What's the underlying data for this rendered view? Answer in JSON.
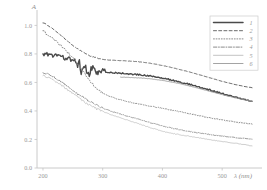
{
  "chart_data": {
    "type": "line",
    "title": "",
    "xlabel": "λ (nm)",
    "ylabel": "A",
    "xlim": [
      190,
      560
    ],
    "ylim": [
      0.0,
      1.08
    ],
    "xticks": [
      200,
      300,
      400,
      500
    ],
    "xtick_labels": [
      "200",
      "300",
      "400",
      "500"
    ],
    "yticks": [
      0.0,
      0.2,
      0.4,
      0.6,
      0.8,
      1.0
    ],
    "ytick_labels": [
      "0.0",
      "0.2",
      "0.4",
      "0.6",
      "0.8",
      "1.0"
    ],
    "grid": false,
    "legend_position": "top-right",
    "legend_entries": [
      {
        "label": "1",
        "style": "solid",
        "width": 1.5,
        "color": "#4a4a4a"
      },
      {
        "label": "2",
        "style": "dashed",
        "width": 1.0,
        "color": "#6a6a6a"
      },
      {
        "label": "3",
        "style": "dotted",
        "width": 1.0,
        "color": "#8a8a8a"
      },
      {
        "label": "4",
        "style": "dashdot",
        "width": 1.0,
        "color": "#8a8a8a"
      },
      {
        "label": "5",
        "style": "solid",
        "width": 0.8,
        "color": "#b4b4b4"
      },
      {
        "label": "6",
        "style": "solid",
        "width": 0.9,
        "color": "#9a9a9a"
      }
    ],
    "series": [
      {
        "name": "1",
        "style": "solid",
        "color": "#4a4a4a",
        "width": 1.4,
        "x": [
          200,
          205,
          210,
          215,
          220,
          225,
          230,
          235,
          240,
          245,
          250,
          255,
          258,
          261,
          264,
          267,
          270,
          273,
          276,
          279,
          282,
          285,
          288,
          292,
          296,
          300,
          305,
          310,
          320,
          330,
          340,
          350,
          360,
          370,
          380,
          390,
          400,
          410,
          420,
          430,
          440,
          450,
          460,
          470,
          480,
          490,
          500,
          510,
          520,
          530,
          540,
          550
        ],
        "y": [
          0.795,
          0.8,
          0.797,
          0.793,
          0.79,
          0.786,
          0.781,
          0.775,
          0.768,
          0.762,
          0.756,
          0.748,
          0.7,
          0.735,
          0.672,
          0.718,
          0.665,
          0.706,
          0.69,
          0.66,
          0.7,
          0.672,
          0.69,
          0.668,
          0.683,
          0.7,
          0.676,
          0.668,
          0.667,
          0.665,
          0.662,
          0.658,
          0.655,
          0.65,
          0.645,
          0.638,
          0.63,
          0.622,
          0.612,
          0.602,
          0.592,
          0.582,
          0.57,
          0.558,
          0.546,
          0.534,
          0.522,
          0.51,
          0.498,
          0.487,
          0.477,
          0.468
        ]
      },
      {
        "name": "2",
        "style": "dashed",
        "color": "#6a6a6a",
        "width": 1.0,
        "x": [
          200,
          210,
          220,
          230,
          240,
          250,
          260,
          270,
          280,
          290,
          300,
          310,
          320,
          330,
          340,
          350,
          360,
          370,
          380,
          390,
          400,
          410,
          420,
          430,
          440,
          450,
          460,
          470,
          480,
          490,
          500,
          510,
          520,
          530,
          540,
          550
        ],
        "y": [
          1.02,
          0.995,
          0.965,
          0.93,
          0.895,
          0.86,
          0.83,
          0.805,
          0.785,
          0.772,
          0.762,
          0.757,
          0.755,
          0.753,
          0.751,
          0.748,
          0.745,
          0.74,
          0.734,
          0.727,
          0.719,
          0.71,
          0.7,
          0.69,
          0.679,
          0.668,
          0.656,
          0.644,
          0.632,
          0.62,
          0.608,
          0.597,
          0.587,
          0.578,
          0.57,
          0.563
        ]
      },
      {
        "name": "3",
        "style": "dotted",
        "color": "#8a8a8a",
        "width": 1.0,
        "x": [
          200,
          210,
          220,
          230,
          240,
          250,
          255,
          260,
          265,
          270,
          275,
          280,
          285,
          290,
          295,
          300,
          310,
          320,
          330,
          340,
          350,
          360,
          370,
          380,
          390,
          400,
          410,
          420,
          430,
          440,
          450,
          460,
          470,
          480,
          490,
          500,
          510,
          520,
          530,
          540,
          550
        ],
        "y": [
          0.96,
          0.93,
          0.895,
          0.858,
          0.818,
          0.775,
          0.75,
          0.72,
          0.69,
          0.66,
          0.632,
          0.605,
          0.58,
          0.558,
          0.54,
          0.525,
          0.505,
          0.49,
          0.478,
          0.468,
          0.458,
          0.45,
          0.442,
          0.434,
          0.426,
          0.418,
          0.41,
          0.402,
          0.394,
          0.385,
          0.377,
          0.368,
          0.36,
          0.352,
          0.344,
          0.337,
          0.33,
          0.324,
          0.318,
          0.313,
          0.308
        ]
      },
      {
        "name": "4",
        "style": "dashdot",
        "color": "#8e8e8e",
        "width": 0.9,
        "x": [
          200,
          210,
          220,
          230,
          240,
          250,
          260,
          270,
          280,
          290,
          300,
          310,
          320,
          330,
          340,
          350,
          360,
          370,
          380,
          390,
          400,
          410,
          420,
          430,
          440,
          450,
          460,
          470,
          480,
          490,
          500,
          510,
          520,
          530,
          540,
          550
        ],
        "y": [
          0.672,
          0.655,
          0.632,
          0.605,
          0.575,
          0.545,
          0.515,
          0.488,
          0.462,
          0.44,
          0.42,
          0.404,
          0.39,
          0.378,
          0.366,
          0.354,
          0.342,
          0.33,
          0.318,
          0.306,
          0.295,
          0.285,
          0.276,
          0.268,
          0.26,
          0.253,
          0.247,
          0.241,
          0.235,
          0.229,
          0.224,
          0.219,
          0.214,
          0.21,
          0.206,
          0.202
        ]
      },
      {
        "name": "5",
        "style": "solid",
        "color": "#c0c0c0",
        "width": 0.8,
        "x": [
          200,
          210,
          220,
          230,
          240,
          250,
          260,
          270,
          280,
          290,
          300,
          310,
          320,
          330,
          340,
          350,
          360,
          370,
          380,
          390,
          400,
          410,
          420,
          430,
          440,
          450,
          460,
          470,
          480,
          490,
          500,
          510,
          520,
          530,
          540,
          550
        ],
        "y": [
          0.648,
          0.63,
          0.608,
          0.582,
          0.552,
          0.52,
          0.49,
          0.462,
          0.436,
          0.414,
          0.396,
          0.38,
          0.366,
          0.352,
          0.338,
          0.324,
          0.31,
          0.296,
          0.283,
          0.27,
          0.258,
          0.248,
          0.24,
          0.233,
          0.226,
          0.219,
          0.212,
          0.205,
          0.198,
          0.192,
          0.186,
          0.18,
          0.174,
          0.168,
          0.162,
          0.155
        ]
      },
      {
        "name": "6",
        "style": "solid",
        "color": "#9a9a9a",
        "width": 0.9,
        "x": [
          330,
          340,
          350,
          360,
          370,
          380,
          390,
          400,
          410,
          420,
          430,
          440,
          450,
          460,
          470,
          480,
          490,
          500,
          510,
          520,
          530,
          540,
          550
        ],
        "y": [
          0.637,
          0.636,
          0.634,
          0.632,
          0.629,
          0.625,
          0.62,
          0.614,
          0.607,
          0.599,
          0.59,
          0.58,
          0.57,
          0.559,
          0.548,
          0.537,
          0.526,
          0.515,
          0.504,
          0.494,
          0.484,
          0.475,
          0.467
        ]
      }
    ]
  }
}
